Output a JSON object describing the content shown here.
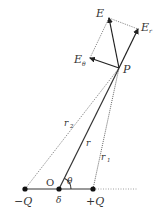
{
  "diagram": {
    "colors": {
      "line": "#333333",
      "dotted": "#555555",
      "axis": "#777777",
      "background": "#ffffff"
    },
    "points": {
      "P": {
        "x": 119,
        "y": 68,
        "label": "P"
      },
      "minusQ": {
        "x": 25,
        "y": 189,
        "label": "−Q"
      },
      "origin": {
        "x": 59,
        "y": 189,
        "label": "O"
      },
      "plusQ": {
        "x": 93,
        "y": 189,
        "label": "+Q"
      }
    },
    "vectors": {
      "E": {
        "label": "E",
        "tip": {
          "x": 109,
          "y": 18
        }
      },
      "E_r": {
        "label": "E",
        "sub": "r",
        "tip": {
          "x": 138,
          "y": 29
        }
      },
      "E_theta": {
        "label": "E",
        "sub": "θ",
        "tip": {
          "x": 90,
          "y": 58
        }
      }
    },
    "distances": {
      "r": {
        "label": "r"
      },
      "r1": {
        "label": "r",
        "sub": "1"
      },
      "r2": {
        "label": "r",
        "sub": "2"
      }
    },
    "angle": {
      "label": "θ"
    },
    "offset": {
      "label": "δ"
    }
  }
}
